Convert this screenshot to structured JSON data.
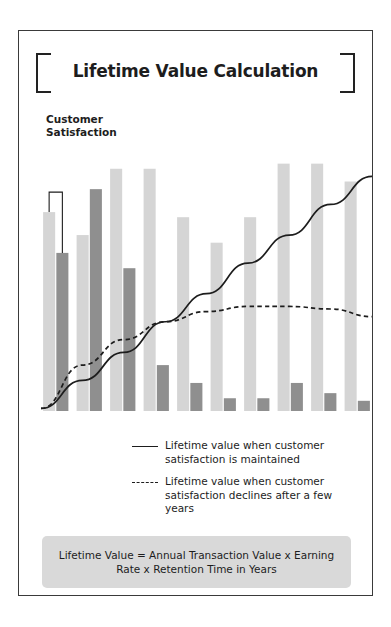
{
  "header": {
    "title": "Lifetime Value Calculation",
    "bracket_left": "bracket-left",
    "bracket_right": "bracket-right"
  },
  "axis": {
    "y_label": "Customer\nSatisfaction"
  },
  "legend": {
    "position": "below-plot",
    "entries": [
      {
        "marker": "solid-line",
        "label": "Lifetime value when customer satisfaction is maintained"
      },
      {
        "marker": "dashed-line",
        "label": "Lifetime value when customer satisfaction declines after a few years"
      }
    ]
  },
  "formula": {
    "text": "Lifetime Value = Annual Transaction Value x Earning Rate x Retention Time in Years"
  },
  "colors": {
    "bar_light": "#d5d5d5",
    "bar_dark": "#8f8f8f",
    "line": "#1d1d1d",
    "frame": "#3a3a3a",
    "formula_background": "#d9d9d9",
    "text": "#1d1d1d"
  },
  "chart_data": {
    "type": "bar",
    "title": "Lifetime Value Calculation",
    "xlabel": "",
    "ylabel": "Customer Satisfaction",
    "ylim": [
      0,
      100
    ],
    "grid": false,
    "legend_position": "bottom",
    "categories": [
      "1",
      "2",
      "3",
      "4",
      "5",
      "6",
      "7",
      "8",
      "9",
      "10"
    ],
    "series": [
      {
        "name": "Satisfaction maintained",
        "marker": "bar-light",
        "color": "#d5d5d5",
        "values": [
          78,
          69,
          95,
          95,
          76,
          66,
          76,
          97,
          97,
          90
        ]
      },
      {
        "name": "Satisfaction declines",
        "marker": "bar-dark",
        "color": "#8f8f8f",
        "values": [
          62,
          87,
          56,
          18,
          11,
          5,
          5,
          11,
          7,
          4
        ]
      },
      {
        "name": "Lifetime value when customer satisfaction is maintained",
        "marker": "solid-line",
        "color": "#1d1d1d",
        "type": "line",
        "x": [
          0,
          12.5,
          25,
          37.5,
          50,
          62.5,
          75,
          87.5,
          100
        ],
        "values": [
          1,
          12,
          23,
          35,
          46,
          58,
          69,
          81,
          92
        ]
      },
      {
        "name": "Lifetime value when customer satisfaction declines after a few years",
        "marker": "dashed-line",
        "color": "#1d1d1d",
        "type": "line",
        "x": [
          0,
          12.5,
          25,
          37.5,
          50,
          62.5,
          75,
          87.5,
          100
        ],
        "values": [
          1,
          18,
          28,
          35,
          39,
          41,
          41,
          40,
          37
        ]
      }
    ],
    "annotations": [
      {
        "name": "satisfaction-drop-bracket",
        "text": "",
        "from_series": "Satisfaction maintained",
        "to_series": "Satisfaction declines",
        "category": "1"
      }
    ]
  }
}
